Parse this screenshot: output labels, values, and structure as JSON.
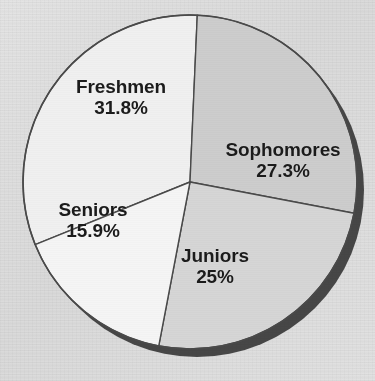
{
  "chart_data": {
    "type": "pie",
    "title": "",
    "subtitle": "",
    "xlabel": "",
    "ylabel": "",
    "legend_position": "none",
    "labels_inside": true,
    "categories": [
      "Freshmen",
      "Sophomores",
      "Juniors",
      "Seniors"
    ],
    "values": [
      31.8,
      27.3,
      25,
      15.9
    ],
    "value_unit": "percent",
    "slices": [
      {
        "name": "Freshmen",
        "value": 31.8,
        "label": "Freshmen",
        "value_label": "31.8%",
        "color": "#f0f0f0",
        "start_angle_deg": 248.0,
        "end_angle_deg": 362.5,
        "sweep_deg": 114.5
      },
      {
        "name": "Sophomores",
        "value": 27.3,
        "label": "Sophomores",
        "value_label": "27.3%",
        "color": "#cdcdcd",
        "start_angle_deg": 2.5,
        "end_angle_deg": 100.8,
        "sweep_deg": 98.3
      },
      {
        "name": "Juniors",
        "value": 25,
        "label": "Juniors",
        "value_label": "25%",
        "color": "#d6d6d6",
        "start_angle_deg": 100.8,
        "end_angle_deg": 190.8,
        "sweep_deg": 90.0
      },
      {
        "name": "Seniors",
        "value": 15.9,
        "label": "Seniors",
        "value_label": "15.9%",
        "color": "#f5f5f5",
        "start_angle_deg": 190.8,
        "end_angle_deg": 248.0,
        "sweep_deg": 57.2
      }
    ],
    "total": 100.0,
    "geometry": {
      "center_x": 190,
      "center_y": 182,
      "radius": 167,
      "shadow_offset_x": 7,
      "shadow_offset_y": 8
    },
    "style": {
      "background_color": "#dcdcdc",
      "outline_color": "#4a4a4a",
      "shadow_color": "#3a3a3a",
      "label_color": "#1b1b1b"
    }
  }
}
